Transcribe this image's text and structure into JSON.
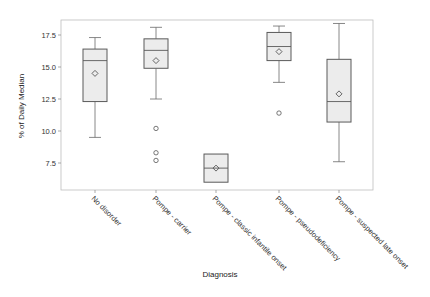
{
  "chart_data": {
    "type": "box",
    "title": "",
    "xlabel": "Diagnosis",
    "ylabel": "% of Daily Median",
    "ylim": [
      5.4,
      18.7
    ],
    "yticks": [
      7.5,
      10.0,
      12.5,
      15.0,
      17.5
    ],
    "ytick_labels": [
      "7.5",
      "10.0",
      "12.5",
      "15.0",
      "17.5"
    ],
    "grid": false,
    "legend": null,
    "categories": [
      "No disorder",
      "Pompe - carrier",
      "Pompe - classic infantile onset",
      "Pompe - pseudodeficiency",
      "Pompe - suspected late onset"
    ],
    "series": [
      {
        "name": "No disorder",
        "whisker_low": 9.5,
        "q1": 12.3,
        "median": 15.5,
        "q3": 16.4,
        "whisker_high": 17.3,
        "mean": 14.5,
        "outliers": []
      },
      {
        "name": "Pompe - carrier",
        "whisker_low": 12.5,
        "q1": 14.9,
        "median": 16.3,
        "q3": 17.2,
        "whisker_high": 18.1,
        "mean": 15.5,
        "outliers": [
          10.2,
          8.3,
          7.7
        ]
      },
      {
        "name": "Pompe - classic infantile onset",
        "whisker_low": 6.0,
        "q1": 6.0,
        "median": 7.1,
        "q3": 8.2,
        "whisker_high": 8.2,
        "mean": 7.1,
        "outliers": []
      },
      {
        "name": "Pompe - pseudodeficiency",
        "whisker_low": 13.8,
        "q1": 15.5,
        "median": 16.6,
        "q3": 17.7,
        "whisker_high": 18.2,
        "mean": 16.2,
        "outliers": [
          11.4
        ]
      },
      {
        "name": "Pompe - suspected late onset",
        "whisker_low": 7.6,
        "q1": 10.7,
        "median": 12.3,
        "q3": 15.6,
        "whisker_high": 18.4,
        "mean": 12.9,
        "outliers": []
      }
    ],
    "colors": {
      "box_fill": "#ececec",
      "box_stroke": "#5a5a5a",
      "frame": "#bdbdbd",
      "whisker": "#6a6a6a"
    }
  }
}
